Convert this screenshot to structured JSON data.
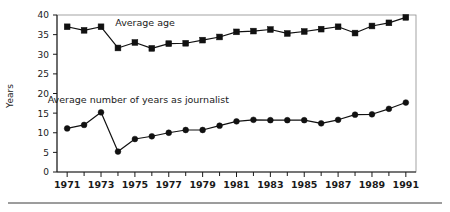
{
  "chart_data": {
    "type": "line",
    "title": "",
    "xlabel": "",
    "ylabel": "Years",
    "xlim": [
      1970.4,
      1991.6
    ],
    "ylim": [
      0,
      40
    ],
    "grid": false,
    "legend_position": "inline-annotation",
    "x": [
      1971,
      1972,
      1973,
      1974,
      1975,
      1976,
      1977,
      1978,
      1979,
      1980,
      1981,
      1982,
      1983,
      1984,
      1985,
      1986,
      1987,
      1988,
      1989,
      1990,
      1991
    ],
    "x_tick_labels": [
      "1971",
      "1973",
      "1975",
      "1977",
      "1979",
      "1981",
      "1983",
      "1985",
      "1987",
      "1989",
      "1991"
    ],
    "x_tick_values": [
      1971,
      1973,
      1975,
      1977,
      1979,
      1981,
      1983,
      1985,
      1987,
      1989,
      1991
    ],
    "y_tick_labels": [
      "0",
      "5",
      "10",
      "15",
      "20",
      "25",
      "30",
      "35",
      "40"
    ],
    "y_tick_values": [
      0,
      5,
      10,
      15,
      20,
      25,
      30,
      35,
      40
    ],
    "series": [
      {
        "name": "Average age",
        "marker": "square",
        "label_x": 1975.6,
        "label_y": 37.2,
        "values": [
          37.0,
          36.1,
          37.0,
          31.6,
          33.0,
          31.5,
          32.7,
          32.8,
          33.6,
          34.4,
          35.7,
          35.9,
          36.3,
          35.3,
          35.8,
          36.4,
          37.0,
          35.4,
          37.2,
          38.0,
          39.4
        ]
      },
      {
        "name": "Average number of years as journalist",
        "marker": "circle",
        "label_x": 1975.2,
        "label_y": 17.6,
        "values": [
          11.1,
          12.0,
          15.2,
          5.2,
          8.4,
          9.1,
          10.0,
          10.7,
          10.7,
          11.8,
          12.9,
          13.3,
          13.2,
          13.2,
          13.2,
          12.4,
          13.3,
          14.6,
          14.7,
          16.1,
          17.7
        ]
      }
    ]
  },
  "figure": {
    "y_axis_title": "Years"
  }
}
